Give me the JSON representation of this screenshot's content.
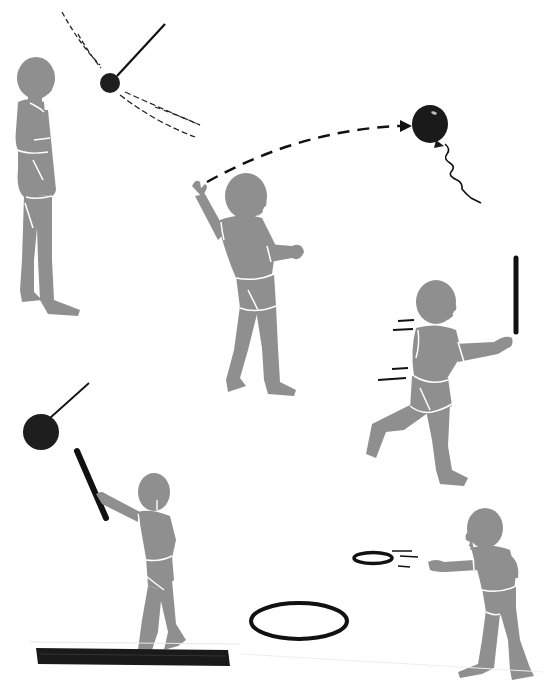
{
  "illustration": {
    "title": "Children's ball, balloon, stick and ring activities",
    "colors": {
      "figure": "#8f8f8f",
      "figure_outline": "#ffffff",
      "object": "#1a1a1a",
      "background": "#ffffff"
    },
    "scenes": [
      {
        "id": "standing-child-watching-pendulum-ball",
        "label": "Child standing, watching a swinging ball"
      },
      {
        "id": "child-tossing-balloon",
        "label": "Child tossing a balloon along a dashed arc"
      },
      {
        "id": "child-running-with-stick",
        "label": "Child running holding a stick upright"
      },
      {
        "id": "child-on-beam-hitting-ball",
        "label": "Child on a balance beam striking a hanging ball with a stick"
      },
      {
        "id": "child-throwing-ring",
        "label": "Child throwing a ring toward a hoop on the floor"
      }
    ]
  }
}
